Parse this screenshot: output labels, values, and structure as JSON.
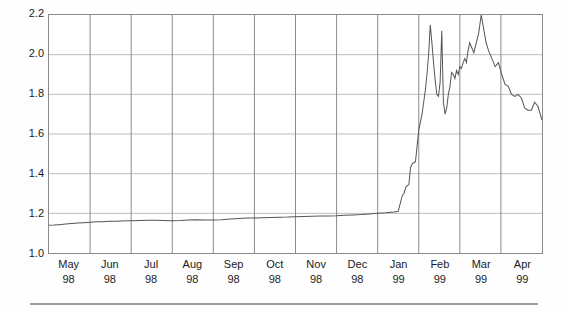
{
  "chart_data": {
    "type": "line",
    "title": "",
    "subtitle": "",
    "xlabel": "",
    "ylabel": "",
    "ylim": [
      1.0,
      2.2
    ],
    "yticks": [
      "1.0",
      "1.2",
      "1.4",
      "1.6",
      "1.8",
      "2.0",
      "2.2"
    ],
    "ytick_values": [
      1.0,
      1.2,
      1.4,
      1.6,
      1.8,
      2.0,
      2.2
    ],
    "grid": true,
    "grid_vertical_color": "#8a8a8a",
    "grid_horizontal_color": "#bcbcbc",
    "legend": "none",
    "line_color": "#555555",
    "line_width": 1,
    "categories": [
      {
        "month": "May",
        "year": "98"
      },
      {
        "month": "Jun",
        "year": "98"
      },
      {
        "month": "Jul",
        "year": "98"
      },
      {
        "month": "Aug",
        "year": "98"
      },
      {
        "month": "Sep",
        "year": "98"
      },
      {
        "month": "Oct",
        "year": "98"
      },
      {
        "month": "Nov",
        "year": "98"
      },
      {
        "month": "Dec",
        "year": "98"
      },
      {
        "month": "Jan",
        "year": "99"
      },
      {
        "month": "Feb",
        "year": "99"
      },
      {
        "month": "Mar",
        "year": "99"
      },
      {
        "month": "Apr",
        "year": "99"
      }
    ],
    "xlim": [
      0,
      12
    ],
    "series": [
      {
        "name": "series-1",
        "x": [
          0.0,
          0.12,
          0.25,
          0.4,
          0.55,
          0.7,
          0.85,
          1.0,
          1.15,
          1.3,
          1.45,
          1.6,
          1.75,
          1.9,
          2.05,
          2.2,
          2.4,
          2.6,
          2.8,
          3.0,
          3.2,
          3.4,
          3.6,
          3.8,
          4.0,
          4.2,
          4.4,
          4.55,
          4.7,
          4.85,
          5.0,
          5.2,
          5.4,
          5.6,
          5.8,
          6.0,
          6.2,
          6.4,
          6.6,
          6.8,
          7.0,
          7.2,
          7.4,
          7.6,
          7.8,
          8.0,
          8.2,
          8.4,
          8.5,
          8.55,
          8.6,
          8.64,
          8.68,
          8.72,
          8.76,
          8.8,
          8.84,
          8.88,
          8.92,
          8.96,
          9.0,
          9.04,
          9.08,
          9.12,
          9.16,
          9.2,
          9.24,
          9.28,
          9.32,
          9.36,
          9.4,
          9.44,
          9.48,
          9.52,
          9.56,
          9.6,
          9.64,
          9.68,
          9.72,
          9.76,
          9.8,
          9.84,
          9.88,
          9.92,
          9.96,
          10.0,
          10.04,
          10.08,
          10.12,
          10.16,
          10.2,
          10.24,
          10.28,
          10.34,
          10.4,
          10.46,
          10.52,
          10.58,
          10.64,
          10.7,
          10.78,
          10.86,
          10.94,
          11.02,
          11.1,
          11.18,
          11.26,
          11.34,
          11.42,
          11.5,
          11.58,
          11.66,
          11.74,
          11.82,
          11.9,
          12.0
        ],
        "y": [
          1.14,
          1.141,
          1.143,
          1.146,
          1.149,
          1.151,
          1.153,
          1.155,
          1.157,
          1.158,
          1.16,
          1.16,
          1.161,
          1.162,
          1.163,
          1.164,
          1.165,
          1.165,
          1.164,
          1.163,
          1.164,
          1.166,
          1.168,
          1.167,
          1.166,
          1.168,
          1.171,
          1.173,
          1.175,
          1.176,
          1.177,
          1.178,
          1.179,
          1.18,
          1.181,
          1.183,
          1.184,
          1.185,
          1.186,
          1.187,
          1.188,
          1.19,
          1.192,
          1.194,
          1.197,
          1.2,
          1.203,
          1.207,
          1.21,
          1.25,
          1.29,
          1.3,
          1.33,
          1.34,
          1.345,
          1.43,
          1.45,
          1.455,
          1.46,
          1.54,
          1.62,
          1.66,
          1.7,
          1.76,
          1.82,
          1.9,
          2.0,
          2.15,
          2.06,
          1.96,
          1.87,
          1.8,
          1.79,
          1.86,
          2.12,
          1.76,
          1.7,
          1.73,
          1.8,
          1.84,
          1.91,
          1.9,
          1.88,
          1.92,
          1.9,
          1.94,
          1.93,
          1.96,
          1.98,
          1.96,
          2.02,
          2.06,
          2.04,
          2.01,
          2.06,
          2.11,
          2.2,
          2.13,
          2.06,
          2.02,
          1.98,
          1.94,
          1.96,
          1.9,
          1.85,
          1.84,
          1.8,
          1.79,
          1.8,
          1.78,
          1.73,
          1.72,
          1.72,
          1.76,
          1.74,
          1.67
        ]
      }
    ]
  }
}
